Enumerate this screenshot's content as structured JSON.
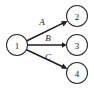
{
  "diagram": {
    "type": "directed-graph",
    "background_color": "#ffffff",
    "stroke_color": "#1c1c1c",
    "node_fill_color": "#ffffff",
    "nodes": [
      {
        "id": "1",
        "label": "1",
        "cx": 17,
        "cy": 45,
        "r": 10.5
      },
      {
        "id": "2",
        "label": "2",
        "cx": 77,
        "cy": 16,
        "r": 10.5
      },
      {
        "id": "3",
        "label": "3",
        "cx": 77,
        "cy": 45,
        "r": 10.5
      },
      {
        "id": "4",
        "label": "4",
        "cx": 77,
        "cy": 73,
        "r": 10.5
      }
    ],
    "edges": [
      {
        "id": "edge-A",
        "label": "A",
        "from": "1",
        "to": "2",
        "x1": 26.5,
        "y1": 41.0,
        "x2": 66.8,
        "y2": 21.3,
        "label_x": 42,
        "label_y": 22
      },
      {
        "id": "edge-B",
        "label": "B",
        "from": "1",
        "to": "3",
        "x1": 27.5,
        "y1": 45.0,
        "x2": 66.0,
        "y2": 45.0,
        "label_x": 48,
        "label_y": 38
      },
      {
        "id": "edge-C",
        "label": "C",
        "from": "1",
        "to": "4",
        "x1": 26.0,
        "y1": 49.5,
        "x2": 66.8,
        "y2": 68.6,
        "label_x": 48,
        "label_y": 57
      }
    ]
  }
}
